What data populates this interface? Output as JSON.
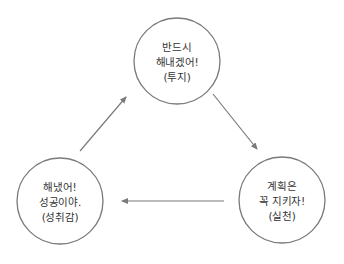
{
  "diagram": {
    "type": "cycle",
    "colors": {
      "stroke": "#7a7a7a",
      "text": "#333333",
      "background": "#ffffff"
    },
    "nodes": [
      {
        "id": "plan",
        "lines": [
          "반드시",
          "해내겠어!",
          "(투지)"
        ],
        "cx": 177,
        "cy": 61,
        "r": 43
      },
      {
        "id": "execute",
        "lines": [
          "계획은",
          "꼭 지키자!",
          "(실천)"
        ],
        "cx": 282,
        "cy": 200,
        "r": 43
      },
      {
        "id": "achieve",
        "lines": [
          "해냈어!",
          "성공이야.",
          "(성취감)"
        ],
        "cx": 60,
        "cy": 201,
        "r": 43
      }
    ],
    "edges": [
      {
        "from": "plan",
        "to": "execute"
      },
      {
        "from": "execute",
        "to": "achieve"
      },
      {
        "from": "achieve",
        "to": "plan"
      }
    ]
  }
}
